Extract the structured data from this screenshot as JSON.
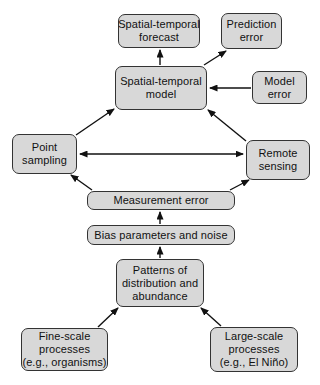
{
  "diagram": {
    "colors": {
      "background": "#ffffff",
      "box_fill": "#d8d8d8",
      "box_border": "#333333",
      "text": "#111111",
      "arrow": "#111111"
    },
    "nodes": [
      {
        "id": "spatial-temporal-forecast",
        "lines": [
          "Spatial-temporal",
          "forecast"
        ],
        "x": 118,
        "y": 14,
        "w": 82,
        "h": 34
      },
      {
        "id": "prediction-error",
        "lines": [
          "Prediction",
          "error"
        ],
        "x": 221,
        "y": 13,
        "w": 61,
        "h": 36
      },
      {
        "id": "spatial-temporal-model",
        "lines": [
          "Spatial-temporal",
          "model"
        ],
        "x": 115,
        "y": 66,
        "w": 92,
        "h": 44
      },
      {
        "id": "model-error",
        "lines": [
          "Model",
          "error"
        ],
        "x": 252,
        "y": 71,
        "w": 55,
        "h": 33
      },
      {
        "id": "point-sampling",
        "lines": [
          "Point",
          "sampling"
        ],
        "x": 12,
        "y": 134,
        "w": 65,
        "h": 40
      },
      {
        "id": "remote-sensing",
        "lines": [
          "Remote",
          "sensing"
        ],
        "x": 246,
        "y": 140,
        "w": 64,
        "h": 40
      },
      {
        "id": "measurement-error",
        "lines": [
          "Measurement error"
        ],
        "x": 87,
        "y": 191,
        "w": 148,
        "h": 19
      },
      {
        "id": "bias-parameters-and-noise",
        "lines": [
          "Bias parameters and noise"
        ],
        "x": 87,
        "y": 225,
        "w": 148,
        "h": 20
      },
      {
        "id": "patterns-of-distribution-and-abundance",
        "lines": [
          "Patterns of",
          "distribution and",
          "abundance"
        ],
        "x": 116,
        "y": 259,
        "w": 88,
        "h": 48
      },
      {
        "id": "fine-scale-processes",
        "lines": [
          "Fine-scale",
          "processes",
          "(e.g., organisms)"
        ],
        "x": 21,
        "y": 328,
        "w": 87,
        "h": 43
      },
      {
        "id": "large-scale-processes",
        "lines": [
          "Large-scale",
          "processes",
          "(e.g., El Niño)"
        ],
        "x": 210,
        "y": 327,
        "w": 88,
        "h": 45
      }
    ],
    "edges": [
      {
        "name": "model-to-forecast",
        "x1": 160,
        "y1": 65,
        "x2": 160,
        "y2": 50,
        "double": false
      },
      {
        "name": "model-to-prediction-error",
        "x1": 204,
        "y1": 65,
        "x2": 226,
        "y2": 51,
        "double": false
      },
      {
        "name": "model-error-to-model",
        "x1": 251,
        "y1": 88,
        "x2": 210,
        "y2": 88,
        "double": false
      },
      {
        "name": "point-sampling-to-model",
        "x1": 76,
        "y1": 135,
        "x2": 114,
        "y2": 109,
        "double": false
      },
      {
        "name": "remote-sensing-to-model",
        "x1": 246,
        "y1": 141,
        "x2": 208,
        "y2": 110,
        "double": false
      },
      {
        "name": "point-sampling-remote-sensing-bidirectional",
        "x1": 80,
        "y1": 154,
        "x2": 243,
        "y2": 154,
        "double": true
      },
      {
        "name": "measurement-error-to-point-sampling",
        "x1": 92,
        "y1": 190,
        "x2": 71,
        "y2": 175,
        "double": false
      },
      {
        "name": "measurement-error-to-remote-sensing",
        "x1": 230,
        "y1": 190,
        "x2": 249,
        "y2": 180,
        "double": false
      },
      {
        "name": "bias-to-measurement-error",
        "x1": 160,
        "y1": 224,
        "x2": 160,
        "y2": 212,
        "double": false
      },
      {
        "name": "patterns-to-bias",
        "x1": 160,
        "y1": 258,
        "x2": 160,
        "y2": 247,
        "double": false
      },
      {
        "name": "fine-scale-to-patterns",
        "x1": 98,
        "y1": 327,
        "x2": 118,
        "y2": 308,
        "double": false
      },
      {
        "name": "large-scale-to-patterns",
        "x1": 221,
        "y1": 326,
        "x2": 201,
        "y2": 308,
        "double": false
      }
    ]
  }
}
